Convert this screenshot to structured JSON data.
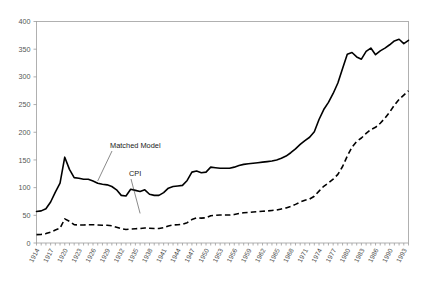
{
  "chart_data": {
    "type": "line",
    "title": "",
    "subtitle": "",
    "xlabel": "",
    "ylabel": "",
    "ylim": [
      0,
      400
    ],
    "ytick_labels": [
      "0",
      "50",
      "100",
      "150",
      "200",
      "250",
      "300",
      "350",
      "400"
    ],
    "ytick_values": [
      0,
      50,
      100,
      150,
      200,
      250,
      300,
      350,
      400
    ],
    "grid": false,
    "legend_position": "inline-annotations",
    "x_tick_labels": [
      "1914",
      "1917",
      "1920",
      "1923",
      "1926",
      "1929",
      "1932",
      "1935",
      "1938",
      "1941",
      "1944",
      "1947",
      "1950",
      "1953",
      "1956",
      "1959",
      "1962",
      "1965",
      "1968",
      "1971",
      "1974",
      "1977",
      "1980",
      "1983",
      "1986",
      "1990",
      "1993"
    ],
    "x": [
      1914,
      1915,
      1916,
      1917,
      1918,
      1919,
      1920,
      1921,
      1922,
      1923,
      1924,
      1925,
      1926,
      1927,
      1928,
      1929,
      1930,
      1931,
      1932,
      1933,
      1934,
      1935,
      1936,
      1937,
      1938,
      1939,
      1940,
      1941,
      1942,
      1943,
      1944,
      1945,
      1946,
      1947,
      1948,
      1949,
      1950,
      1951,
      1952,
      1953,
      1954,
      1955,
      1956,
      1957,
      1958,
      1959,
      1960,
      1961,
      1962,
      1963,
      1964,
      1965,
      1966,
      1967,
      1968,
      1969,
      1970,
      1971,
      1972,
      1973,
      1974,
      1975,
      1976,
      1977,
      1978,
      1979,
      1980,
      1981,
      1982,
      1983,
      1984,
      1985,
      1986,
      1987,
      1988,
      1989,
      1990,
      1991,
      1992,
      1993
    ],
    "series": [
      {
        "name": "Matched Model",
        "style": "solid",
        "values": [
          57,
          58,
          62,
          74,
          92,
          108,
          155,
          133,
          118,
          117,
          115,
          115,
          112,
          108,
          106,
          105,
          102,
          96,
          86,
          85,
          97,
          95,
          93,
          96,
          88,
          86,
          86,
          91,
          99,
          102,
          103,
          104,
          113,
          128,
          130,
          127,
          128,
          137,
          136,
          135,
          135,
          135,
          137,
          140,
          142,
          143,
          144,
          145,
          146,
          147,
          148,
          150,
          153,
          157,
          163,
          170,
          178,
          185,
          191,
          201,
          223,
          241,
          254,
          270,
          289,
          315,
          341,
          344,
          336,
          332,
          346,
          352,
          340,
          347,
          352,
          358,
          365,
          368,
          360,
          366
        ],
        "endpoint_value": 366,
        "peak_1920": 155,
        "peak_1980s": 366
      },
      {
        "name": "CPI",
        "style": "dashed",
        "values": [
          33,
          34,
          37,
          43,
          51,
          58,
          95,
          85,
          72,
          71,
          71,
          72,
          72,
          71,
          70,
          70,
          68,
          62,
          56,
          53,
          55,
          56,
          57,
          59,
          58,
          57,
          57,
          60,
          67,
          71,
          72,
          74,
          80,
          92,
          99,
          98,
          99,
          107,
          109,
          110,
          110,
          110,
          112,
          116,
          119,
          120,
          122,
          123,
          125,
          126,
          128,
          130,
          134,
          138,
          144,
          152,
          161,
          168,
          173,
          184,
          204,
          223,
          236,
          251,
          270,
          301,
          342,
          377,
          400,
          413,
          431,
          446,
          455,
          471,
          491,
          515,
          542,
          565,
          582,
          599
        ],
        "endpoint_value": 275,
        "note_scaled": "dashed curve rendered on same 0-400 axis, ending near 275"
      }
    ],
    "annotations": [
      {
        "text": "Matched Model",
        "target_year": 1927,
        "target_value": 112
      },
      {
        "text": "CPI",
        "target_year": 1936,
        "target_value": 57
      }
    ]
  },
  "axes": {
    "y_axis_name": "value-axis",
    "x_axis_name": "year-axis"
  }
}
